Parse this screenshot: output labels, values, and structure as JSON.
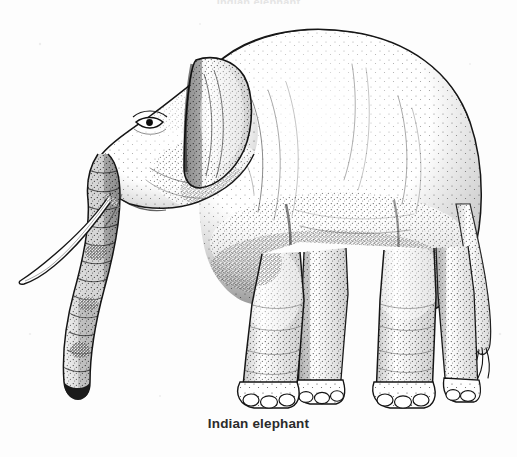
{
  "page": {
    "background_color": "#fdfdfd",
    "width": 517,
    "height": 457,
    "top_clipped_text": "Indian elephant"
  },
  "figure": {
    "caption": "Indian elephant",
    "caption_color": "#2b2b2b",
    "illustration_name": "indian-elephant-line-drawing",
    "medium": "pen-and-ink stipple drawing",
    "subject": "Indian elephant",
    "ink_color": "#1a1a1a",
    "stipple_color": "#3a3a3a",
    "view": "left-facing side profile, standing",
    "anatomy_labels": [
      "head",
      "small rounded ear",
      "eye",
      "trunk",
      "tusk",
      "arched back",
      "rump",
      "tail",
      "foreleg",
      "hind leg",
      "toenails"
    ]
  }
}
